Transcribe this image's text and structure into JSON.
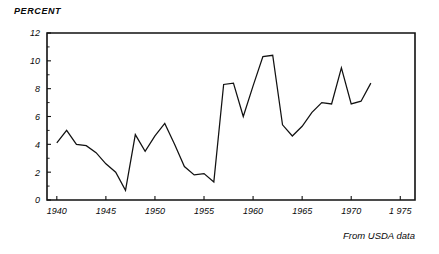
{
  "chart_data": {
    "type": "line",
    "title": "",
    "subtitle": "",
    "xlabel": "",
    "ylabel": "PERCENT",
    "annotation": "From USDA data",
    "grid": false,
    "legend": "none",
    "xlim": [
      1939,
      1976.5
    ],
    "ylim": [
      0,
      12
    ],
    "ytick_labels": [
      "0",
      "2",
      "4",
      "6",
      "8",
      "10",
      "12"
    ],
    "ytick_values": [
      0,
      2,
      4,
      6,
      8,
      10,
      12
    ],
    "yminor_step": 1,
    "xtick_labels": [
      "1940",
      "1945",
      "1950",
      "1955",
      "1960",
      "1965",
      "1970",
      "1 975"
    ],
    "xtick_values": [
      1940,
      1945,
      1950,
      1955,
      1960,
      1965,
      1970,
      1975
    ],
    "x": [
      1940,
      1941,
      1942,
      1943,
      1944,
      1945,
      1946,
      1947,
      1948,
      1949,
      1950,
      1951,
      1952,
      1953,
      1954,
      1955,
      1956,
      1957,
      1958,
      1959,
      1960,
      1961,
      1962,
      1963,
      1964,
      1965,
      1966,
      1967,
      1968,
      1969,
      1970,
      1971,
      1972
    ],
    "values": [
      4.1,
      5.0,
      4.0,
      3.9,
      3.4,
      2.6,
      2.0,
      0.7,
      4.7,
      3.5,
      4.6,
      5.5,
      4.0,
      2.4,
      1.8,
      1.9,
      1.3,
      8.3,
      8.4,
      6.0,
      8.2,
      10.3,
      10.4,
      5.4,
      4.6,
      5.3,
      6.3,
      7.0,
      6.9,
      9.5,
      6.9,
      7.1,
      8.4
    ],
    "series_name": "percent"
  },
  "axis_color": "#111111",
  "line_color": "#111111",
  "background": "#ffffff"
}
